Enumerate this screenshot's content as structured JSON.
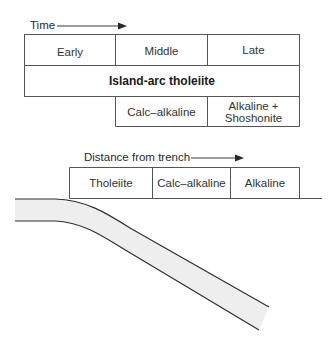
{
  "top_panel": {
    "axis_label": "Time",
    "stages": [
      "Early",
      "Middle",
      "Late"
    ],
    "main_series": "Island-arc tholeiite",
    "later_series": [
      "Calc–alkaline",
      "Alkaline +",
      "Shoshonite"
    ]
  },
  "bottom_panel": {
    "axis_label": "Distance from trench",
    "zones": [
      "Tholeiite",
      "Calc–alkaline",
      "Alkaline"
    ]
  },
  "colors": {
    "line": "#3a3a3a",
    "slab_fill": "#eeeeee",
    "text": "#333333"
  }
}
